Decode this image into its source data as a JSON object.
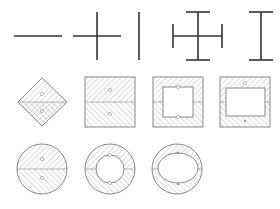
{
  "diagram": {
    "colors": {
      "background": "#ffffff",
      "line": "#333333",
      "outline": "#888888",
      "hatch": "#aaaaaa",
      "divider": "#999999"
    },
    "rows": [
      {
        "name": "line-elements",
        "items": [
          {
            "id": "horizontal-line",
            "type": "line-horizontal"
          },
          {
            "id": "cross",
            "type": "cross"
          },
          {
            "id": "vertical-line",
            "type": "line-vertical"
          },
          {
            "id": "capped-cross",
            "type": "capped-cross"
          },
          {
            "id": "i-beam",
            "type": "i-beam"
          }
        ]
      },
      {
        "name": "rectangular-sections",
        "items": [
          {
            "id": "diamond-solid",
            "type": "rotated-square-solid"
          },
          {
            "id": "square-solid",
            "type": "square-solid"
          },
          {
            "id": "square-hollow-thick",
            "type": "square-hollow-thick-wall"
          },
          {
            "id": "square-hollow-thin",
            "type": "rectangle-hollow-thin-wall"
          }
        ]
      },
      {
        "name": "circular-sections",
        "items": [
          {
            "id": "circle-solid",
            "type": "circle-solid"
          },
          {
            "id": "circle-hollow",
            "type": "circle-hollow"
          },
          {
            "id": "circle-hollow-elliptic",
            "type": "circle-hollow-elliptic"
          }
        ]
      }
    ]
  }
}
